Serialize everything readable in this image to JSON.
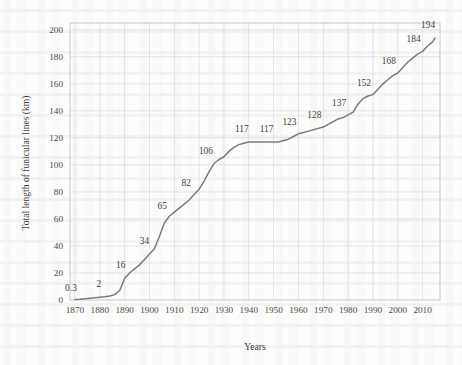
{
  "chart_data": {
    "type": "line",
    "title": "",
    "xlabel": "Years",
    "ylabel": "Total length of funicular lines (km)",
    "xlim": [
      1868,
      2017
    ],
    "ylim": [
      0,
      205
    ],
    "xticks": [
      1870,
      1880,
      1890,
      1900,
      1910,
      1920,
      1930,
      1940,
      1950,
      1960,
      1970,
      1980,
      1990,
      2000,
      2010
    ],
    "yticks": [
      0,
      20,
      40,
      60,
      80,
      100,
      120,
      140,
      160,
      180,
      200
    ],
    "grid": true,
    "legend": "none",
    "line_color": "#7b7b7b",
    "series": [
      {
        "name": "Total length of funicular lines",
        "x": [
          1870,
          1872,
          1874,
          1876,
          1878,
          1880,
          1882,
          1884,
          1886,
          1888,
          1890,
          1892,
          1894,
          1896,
          1898,
          1900,
          1902,
          1904,
          1906,
          1908,
          1910,
          1912,
          1914,
          1916,
          1918,
          1920,
          1922,
          1924,
          1926,
          1928,
          1930,
          1932,
          1934,
          1936,
          1938,
          1940,
          1942,
          1944,
          1946,
          1948,
          1950,
          1952,
          1954,
          1956,
          1958,
          1960,
          1962,
          1964,
          1966,
          1968,
          1970,
          1972,
          1974,
          1976,
          1978,
          1980,
          1982,
          1984,
          1986,
          1988,
          1990,
          1992,
          1994,
          1996,
          1998,
          2000,
          2002,
          2004,
          2006,
          2008,
          2010,
          2012,
          2014,
          2015
        ],
        "y": [
          0.3,
          0.6,
          1.0,
          1.3,
          1.6,
          2.0,
          2.4,
          3.0,
          4.0,
          7.0,
          16.0,
          20.0,
          23.0,
          26.0,
          30.0,
          34.0,
          38.0,
          47.0,
          57.0,
          62.0,
          65.0,
          68.0,
          71.0,
          74.0,
          78.0,
          82.0,
          88.0,
          95.0,
          101.0,
          104.0,
          106.0,
          110.0,
          113.0,
          115.0,
          116.0,
          117.0,
          117.0,
          117.0,
          117.0,
          117.0,
          117.0,
          117.0,
          118.0,
          119.0,
          121.0,
          123.0,
          124.0,
          125.0,
          126.0,
          127.0,
          128.0,
          130.0,
          132.0,
          134.0,
          135.0,
          137.0,
          139.0,
          145.0,
          149.0,
          151.0,
          152.0,
          156.0,
          160.0,
          163.0,
          166.0,
          168.0,
          172.0,
          176.0,
          179.0,
          182.0,
          184.0,
          188.0,
          191.0,
          194.0
        ]
      }
    ],
    "annotations": [
      {
        "label": "0.3",
        "x": 1870,
        "y": 0.3,
        "dx": -4,
        "dy": -9
      },
      {
        "label": "2",
        "x": 1880,
        "y": 2.0,
        "dx": -1,
        "dy": -10
      },
      {
        "label": "16",
        "x": 1890,
        "y": 16.0,
        "dx": -4,
        "dy": -10
      },
      {
        "label": "34",
        "x": 1900,
        "y": 34.0,
        "dx": -5,
        "dy": -10
      },
      {
        "label": "65",
        "x": 1910,
        "y": 65.0,
        "dx": -12,
        "dy": -3
      },
      {
        "label": "82",
        "x": 1920,
        "y": 82.0,
        "dx": -13,
        "dy": -3
      },
      {
        "label": "106",
        "x": 1930,
        "y": 106.0,
        "dx": -18,
        "dy": -3
      },
      {
        "label": "117",
        "x": 1940,
        "y": 117.0,
        "dx": -7,
        "dy": -10
      },
      {
        "label": "117",
        "x": 1950,
        "y": 117.0,
        "dx": -7,
        "dy": -10
      },
      {
        "label": "123",
        "x": 1960,
        "y": 123.0,
        "dx": -9,
        "dy": -9
      },
      {
        "label": "128",
        "x": 1970,
        "y": 128.0,
        "dx": -9,
        "dy": -9
      },
      {
        "label": "137",
        "x": 1980,
        "y": 137.0,
        "dx": -9,
        "dy": -9
      },
      {
        "label": "152",
        "x": 1990,
        "y": 152.0,
        "dx": -9,
        "dy": -9
      },
      {
        "label": "168",
        "x": 2000,
        "y": 168.0,
        "dx": -9,
        "dy": -9
      },
      {
        "label": "184",
        "x": 2010,
        "y": 184.0,
        "dx": -9,
        "dy": -9
      },
      {
        "label": "194",
        "x": 2015,
        "y": 194.0,
        "dx": -7,
        "dy": -10
      }
    ]
  }
}
